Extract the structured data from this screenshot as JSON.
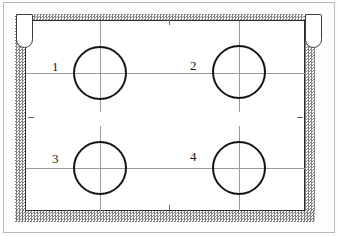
{
  "figure": {
    "type": "technical-line-drawing"
  },
  "vessel": {
    "wall_label": "stippled-wall",
    "cavity_label": "interior-cavity",
    "wall_fill": "#6f6f6f",
    "cavity_fill": "#ffffff",
    "outline_color": "#2b2b2b"
  },
  "tubes": [
    {
      "name": "tube-left",
      "x": 16,
      "y": 14,
      "width": 17,
      "height": 34
    },
    {
      "name": "tube-right",
      "x": 305,
      "y": 14,
      "width": 17,
      "height": 34
    }
  ],
  "bores": [
    {
      "label": "1",
      "cx": 100,
      "cy": 73,
      "r": 27,
      "label_x": 52,
      "label_y": 60
    },
    {
      "label": "2",
      "cx": 239,
      "cy": 72,
      "r": 27,
      "label_x": 190,
      "label_y": 59
    },
    {
      "label": "3",
      "cx": 100,
      "cy": 168,
      "r": 27,
      "label_x": 52,
      "label_y": 152
    },
    {
      "label": "4",
      "cx": 239,
      "cy": 168,
      "r": 27,
      "label_x": 190,
      "label_y": 150
    }
  ],
  "centerlines": {
    "horizontal_rows": [
      73,
      168
    ],
    "vertical_columns": [
      100,
      239
    ],
    "color": "#9a9a9a"
  },
  "edge_ticks": [
    {
      "name": "tick-top",
      "orientation": "vertical",
      "x": 169,
      "y": 20,
      "length": 5
    },
    {
      "name": "tick-bottom",
      "orientation": "vertical",
      "x": 169,
      "y": 204,
      "length": 5
    },
    {
      "name": "tick-left",
      "orientation": "horizontal",
      "x": 28,
      "y": 117,
      "length": 6
    },
    {
      "name": "tick-right",
      "orientation": "horizontal",
      "x": 297,
      "y": 117,
      "length": 6
    }
  ],
  "frame": {
    "border_color": "#b9b9b9"
  }
}
